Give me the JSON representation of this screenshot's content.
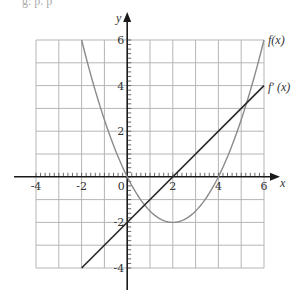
{
  "top_fragment": "g:  p.  p",
  "chart_data": {
    "type": "line",
    "title": "",
    "xlabel": "x",
    "ylabel": "y",
    "xlim": [
      -4,
      6
    ],
    "ylim": [
      -4,
      6
    ],
    "grid": true,
    "grid_step": 1,
    "minor_tick_step": 0.2,
    "x_ticks": [
      -4,
      -2,
      0,
      2,
      4,
      6
    ],
    "y_ticks": [
      -4,
      -2,
      2,
      4,
      6
    ],
    "x_tick_labels": [
      "-4",
      "-2",
      "0",
      "2",
      "4",
      "6"
    ],
    "y_tick_labels": [
      "-4",
      "-2",
      "2",
      "4",
      "6"
    ],
    "legend": "inline labels at right end of curves",
    "series": [
      {
        "name": "f(x)",
        "label": "f(x)",
        "formula": "0.5x^2 - 2x",
        "color": "#8a8a8a",
        "x": [
          -2,
          -1,
          0,
          1,
          2,
          3,
          4,
          5,
          6
        ],
        "y": [
          6,
          2.5,
          0,
          -1.5,
          -2,
          -1.5,
          0,
          2.5,
          6
        ]
      },
      {
        "name": "f'(x)",
        "label": "f′ (x)",
        "formula": "x - 2",
        "color": "#2a2a2a",
        "x": [
          -2,
          6
        ],
        "y": [
          -4,
          4
        ]
      }
    ]
  },
  "labels": {
    "x_axis": "x",
    "y_axis": "y",
    "f": "f(x)",
    "fprime": "f′ (x)"
  }
}
